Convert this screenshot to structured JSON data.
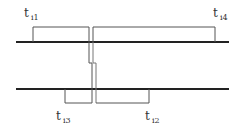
{
  "diagram": {
    "title": "",
    "labels": {
      "ti1": {
        "main": "t",
        "sub": "i1"
      },
      "ti4": {
        "main": "t",
        "sub": "i4"
      },
      "ti3": {
        "main": "t",
        "sub": "i3"
      },
      "ti2": {
        "main": "t",
        "sub": "i2"
      }
    },
    "colors": {
      "axis": "#222222",
      "pulse": "#555555",
      "background": "#ffffff"
    }
  }
}
